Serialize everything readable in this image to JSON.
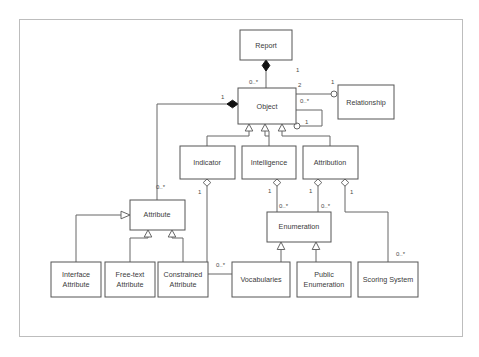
{
  "diagram": {
    "type": "uml-class-diagram",
    "title": "",
    "frame": {
      "x": 19,
      "y": 19,
      "width": 443,
      "height": 317
    },
    "colors": {
      "background": "#ffffff",
      "box_stroke": "#555555",
      "box_fill": "#ffffff",
      "link_stroke": "#666666",
      "frame_stroke": "#bdbdbd",
      "text": "#3a3a3a",
      "filled_diamond": "#111111"
    },
    "classes": [
      {
        "id": "report",
        "label": "Report",
        "lines": [
          "Report"
        ],
        "x": 240,
        "y": 30,
        "width": 52,
        "height": 30
      },
      {
        "id": "object",
        "label": "Object",
        "lines": [
          "Object"
        ],
        "x": 238,
        "y": 88,
        "width": 58,
        "height": 36
      },
      {
        "id": "relationship",
        "label": "Relationship",
        "lines": [
          "Relationship"
        ],
        "x": 338,
        "y": 85,
        "width": 56,
        "height": 34
      },
      {
        "id": "indicator",
        "label": "Indicator",
        "lines": [
          "Indicator"
        ],
        "x": 180,
        "y": 146,
        "width": 55,
        "height": 33
      },
      {
        "id": "intelligence",
        "label": "Intelligence",
        "lines": [
          "Intelligence"
        ],
        "x": 242,
        "y": 146,
        "width": 54,
        "height": 33
      },
      {
        "id": "attribution",
        "label": "Attribution",
        "lines": [
          "Attribution"
        ],
        "x": 303,
        "y": 146,
        "width": 55,
        "height": 33
      },
      {
        "id": "attribute",
        "label": "Attribute",
        "lines": [
          "Attribute"
        ],
        "x": 130,
        "y": 200,
        "width": 55,
        "height": 30
      },
      {
        "id": "enumeration",
        "label": "Enumeration",
        "lines": [
          "Enumeration"
        ],
        "x": 267,
        "y": 212,
        "width": 64,
        "height": 30
      },
      {
        "id": "interface-attribute",
        "label": "Interface Attribute",
        "lines": [
          "Interface",
          "Attribute"
        ],
        "x": 51,
        "y": 262,
        "width": 50,
        "height": 35
      },
      {
        "id": "free-text-attribute",
        "label": "Free-text Attribute",
        "lines": [
          "Free-text",
          "Attribute"
        ],
        "x": 105,
        "y": 262,
        "width": 50,
        "height": 35
      },
      {
        "id": "constrained-attribute",
        "label": "Constrained Attribute",
        "lines": [
          "Constrained",
          "Attribute"
        ],
        "x": 158,
        "y": 262,
        "width": 50,
        "height": 35
      },
      {
        "id": "vocabularies",
        "label": "Vocabularies",
        "lines": [
          "Vocabularies"
        ],
        "x": 232,
        "y": 262,
        "width": 58,
        "height": 35
      },
      {
        "id": "public-enumeration",
        "label": "Public Enumeration",
        "lines": [
          "Public",
          "Enumeration"
        ],
        "x": 297,
        "y": 262,
        "width": 54,
        "height": 35
      },
      {
        "id": "scoring-system",
        "label": "Scoring System",
        "lines": [
          "Scoring System"
        ],
        "x": 358,
        "y": 262,
        "width": 60,
        "height": 35
      }
    ],
    "relationships": [
      {
        "id": "report-object",
        "from": "report",
        "to": "object",
        "kind": "composition",
        "source_multiplicity": "1",
        "target_multiplicity": "0..*"
      },
      {
        "id": "object-relationship",
        "from": "object",
        "to": "relationship",
        "kind": "association",
        "source_multiplicity": "2",
        "target_multiplicity": "1"
      },
      {
        "id": "object-object",
        "from": "object",
        "to": "object",
        "kind": "association",
        "source_multiplicity": "0..*",
        "target_multiplicity": "1"
      },
      {
        "id": "attribute-object",
        "from": "attribute",
        "to": "object",
        "kind": "composition",
        "source_multiplicity": "0..*",
        "target_multiplicity": "1"
      },
      {
        "id": "indicator-object",
        "from": "indicator",
        "to": "object",
        "kind": "generalization",
        "source_multiplicity": "",
        "target_multiplicity": ""
      },
      {
        "id": "intelligence-object",
        "from": "intelligence",
        "to": "object",
        "kind": "generalization",
        "source_multiplicity": "",
        "target_multiplicity": ""
      },
      {
        "id": "attribution-object",
        "from": "attribution",
        "to": "object",
        "kind": "generalization",
        "source_multiplicity": "",
        "target_multiplicity": ""
      },
      {
        "id": "indicator-vocabularies",
        "from": "indicator",
        "to": "vocabularies",
        "kind": "aggregation",
        "source_multiplicity": "1",
        "target_multiplicity": "0..*"
      },
      {
        "id": "intelligence-enumeration",
        "from": "intelligence",
        "to": "enumeration",
        "kind": "aggregation",
        "source_multiplicity": "1",
        "target_multiplicity": "0..*"
      },
      {
        "id": "attribution-enumeration",
        "from": "attribution",
        "to": "enumeration",
        "kind": "aggregation",
        "source_multiplicity": "1",
        "target_multiplicity": "0..*"
      },
      {
        "id": "attribution-scoring-system",
        "from": "attribution",
        "to": "scoring-system",
        "kind": "aggregation",
        "source_multiplicity": "1",
        "target_multiplicity": "0..*"
      },
      {
        "id": "interface-attribute-attribute",
        "from": "interface-attribute",
        "to": "attribute",
        "kind": "generalization",
        "source_multiplicity": "",
        "target_multiplicity": ""
      },
      {
        "id": "free-text-attribute-attribute",
        "from": "free-text-attribute",
        "to": "attribute",
        "kind": "generalization",
        "source_multiplicity": "",
        "target_multiplicity": ""
      },
      {
        "id": "constrained-attribute-attribute",
        "from": "constrained-attribute",
        "to": "attribute",
        "kind": "generalization",
        "source_multiplicity": "",
        "target_multiplicity": ""
      },
      {
        "id": "vocabularies-enumeration",
        "from": "vocabularies",
        "to": "enumeration",
        "kind": "generalization",
        "source_multiplicity": "",
        "target_multiplicity": ""
      },
      {
        "id": "public-enumeration-enumeration",
        "from": "public-enumeration",
        "to": "enumeration",
        "kind": "generalization",
        "source_multiplicity": "",
        "target_multiplicity": ""
      }
    ],
    "multiplicity_labels": [
      {
        "id": "m-report-1",
        "text": "1",
        "x": 296,
        "y": 72
      },
      {
        "id": "m-object-report-0n",
        "text": "0..*",
        "x": 249,
        "y": 84
      },
      {
        "id": "m-object-rel-2",
        "text": "2",
        "x": 298,
        "y": 87
      },
      {
        "id": "m-rel-1",
        "text": "1",
        "x": 331,
        "y": 84
      },
      {
        "id": "m-object-self-0n",
        "text": "0..*",
        "x": 300,
        "y": 103
      },
      {
        "id": "m-object-self-1",
        "text": "1",
        "x": 305,
        "y": 124
      },
      {
        "id": "m-attr-object-1",
        "text": "1",
        "x": 221,
        "y": 99
      },
      {
        "id": "m-attr-object-0n",
        "text": "0..*",
        "x": 156,
        "y": 189
      },
      {
        "id": "m-indicator-1",
        "text": "1",
        "x": 202,
        "y": 193
      },
      {
        "id": "m-indicator-voc-0n",
        "text": "0..*",
        "x": 219,
        "y": 265
      },
      {
        "id": "m-intelligence-1",
        "text": "1",
        "x": 272,
        "y": 192
      },
      {
        "id": "m-intelligence-enum-0n",
        "text": "0..*",
        "x": 277,
        "y": 207
      },
      {
        "id": "m-attribution-enum-1",
        "text": "1",
        "x": 313,
        "y": 192
      },
      {
        "id": "m-attribution-enum-0n",
        "text": "0..*",
        "x": 322,
        "y": 207
      },
      {
        "id": "m-attribution-score-1",
        "text": "1",
        "x": 347,
        "y": 193
      },
      {
        "id": "m-scoring-0n",
        "text": "0..*",
        "x": 398,
        "y": 255
      }
    ]
  }
}
